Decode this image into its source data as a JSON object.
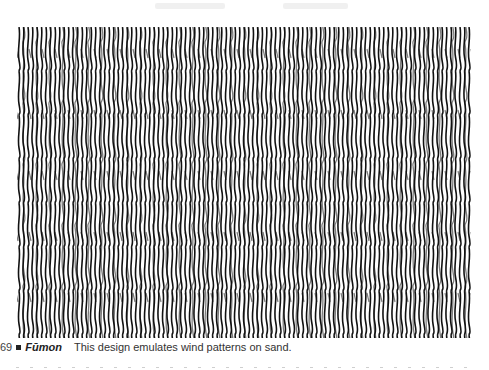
{
  "figure": {
    "pattern_name": "fumon-wind-sand-pattern",
    "pattern_colors": {
      "ink": "#111111",
      "paper": "#ffffff"
    }
  },
  "caption": {
    "number": "69",
    "bullet": "■",
    "title": "Fūmon",
    "text": "This design emulates wind patterns on sand."
  }
}
